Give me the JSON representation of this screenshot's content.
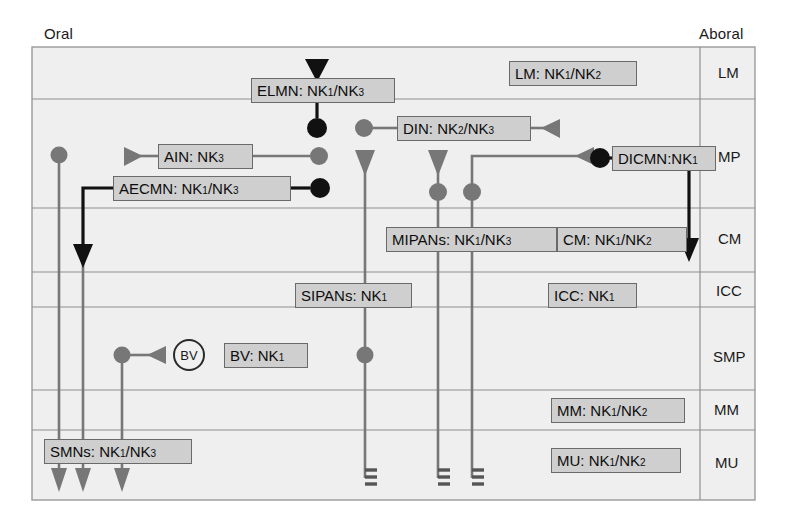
{
  "figure": {
    "orientation_labels": {
      "left": "Oral",
      "right": "Aboral"
    },
    "background": "#efefef",
    "panel_border": "#9a9a9a",
    "row_line_color": "#8f8f8f",
    "box_fill": "#cfcfcf",
    "box_stroke": "#6a6a6a",
    "excitatory_color": "#111111",
    "inhibitory_color": "#777777"
  },
  "layers": [
    {
      "id": "LM",
      "label": "LM",
      "top": 47,
      "bottom": 99
    },
    {
      "id": "MP",
      "label": "MP",
      "top": 99,
      "bottom": 208
    },
    {
      "id": "CM",
      "label": "CM",
      "top": 208,
      "bottom": 272
    },
    {
      "id": "ICC",
      "label": "ICC",
      "top": 272,
      "bottom": 307
    },
    {
      "id": "SMP",
      "label": "SMP",
      "top": 307,
      "bottom": 390
    },
    {
      "id": "MM",
      "label": "MM",
      "top": 390,
      "bottom": 430
    },
    {
      "id": "MU",
      "label": "MU",
      "top": 430,
      "bottom": 500
    }
  ],
  "row_label_x": 718,
  "panel": {
    "x": 32,
    "y": 47,
    "width": 723,
    "height": 453
  },
  "divider_x": 700,
  "nodes": [
    {
      "id": "elmn",
      "label": "ELMN: NK",
      "sub1": "1",
      "mid": "/NK",
      "sub2": "3",
      "x": 251,
      "y": 78,
      "w": 144,
      "h": 25
    },
    {
      "id": "lm",
      "label": "LM: NK",
      "sub1": "1",
      "mid": "/NK",
      "sub2": "2",
      "x": 509,
      "y": 61,
      "w": 128,
      "h": 25
    },
    {
      "id": "din",
      "label": "DIN: NK",
      "sub1": "2",
      "mid": "/NK",
      "sub2": "3",
      "x": 397,
      "y": 116,
      "w": 134,
      "h": 25
    },
    {
      "id": "ain",
      "label": "AIN: NK",
      "sub1": "3",
      "mid": "",
      "sub2": "",
      "x": 158,
      "y": 144,
      "w": 95,
      "h": 25
    },
    {
      "id": "dicmn",
      "label": "DICMN:NK",
      "sub1": "1",
      "mid": "",
      "sub2": "",
      "x": 612,
      "y": 146,
      "w": 104,
      "h": 25
    },
    {
      "id": "aecmn",
      "label": "AECMN: NK",
      "sub1": "1",
      "mid": "/NK",
      "sub2": "3",
      "x": 113,
      "y": 176,
      "w": 178,
      "h": 25
    },
    {
      "id": "mipans",
      "label": "MIPANs: NK",
      "sub1": "1",
      "mid": "/NK",
      "sub2": "3",
      "x": 386,
      "y": 227,
      "w": 171,
      "h": 25
    },
    {
      "id": "cm",
      "label": "CM: NK",
      "sub1": "1",
      "mid": "/NK",
      "sub2": "2",
      "x": 557,
      "y": 227,
      "w": 130,
      "h": 25
    },
    {
      "id": "sipans",
      "label": "SIPANs: NK",
      "sub1": "1",
      "mid": "",
      "sub2": "",
      "x": 295,
      "y": 283,
      "w": 117,
      "h": 25
    },
    {
      "id": "icc",
      "label": "ICC: NK",
      "sub1": "1",
      "mid": "",
      "sub2": "",
      "x": 548,
      "y": 283,
      "w": 89,
      "h": 25
    },
    {
      "id": "bvlab",
      "label": "BV: NK",
      "sub1": "1",
      "mid": "",
      "sub2": "",
      "x": 224,
      "y": 343,
      "w": 84,
      "h": 25
    },
    {
      "id": "mm",
      "label": "MM: NK",
      "sub1": "1",
      "mid": "/NK",
      "sub2": "2",
      "x": 551,
      "y": 398,
      "w": 134,
      "h": 25
    },
    {
      "id": "smns",
      "label": "SMNs: NK",
      "sub1": "1",
      "mid": "/NK",
      "sub2": "3",
      "x": 44,
      "y": 439,
      "w": 148,
      "h": 25
    },
    {
      "id": "mu",
      "label": "MU: NK",
      "sub1": "1",
      "mid": "/NK",
      "sub2": "2",
      "x": 551,
      "y": 448,
      "w": 130,
      "h": 25
    }
  ],
  "bv_marker": {
    "label": "BV",
    "x": 173,
    "y": 341
  }
}
